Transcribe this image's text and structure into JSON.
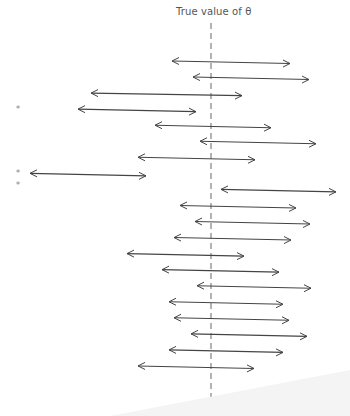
{
  "diagram": {
    "title": "True value of θ",
    "reference_line": {
      "label": "True value of θ",
      "style": "dashed"
    },
    "colors": {
      "line": "#444444",
      "dash": "#666666",
      "marker": "#888888",
      "text": "#555555"
    },
    "marker_glyph": "*",
    "interval_count": 20,
    "intervals": [
      {
        "index": 1,
        "lower": -39,
        "upper": 79,
        "contains_true": true,
        "marked": false
      },
      {
        "index": 2,
        "lower": -18,
        "upper": 98,
        "contains_true": true,
        "marked": false
      },
      {
        "index": 3,
        "lower": -120,
        "upper": 31,
        "contains_true": true,
        "marked": false
      },
      {
        "index": 4,
        "lower": -133,
        "upper": -15,
        "contains_true": false,
        "marked": true
      },
      {
        "index": 5,
        "lower": -56,
        "upper": 60,
        "contains_true": true,
        "marked": false
      },
      {
        "index": 6,
        "lower": -11,
        "upper": 105,
        "contains_true": true,
        "marked": false
      },
      {
        "index": 7,
        "lower": -73,
        "upper": 44,
        "contains_true": true,
        "marked": false
      },
      {
        "index": 8,
        "lower": -181,
        "upper": -65,
        "contains_true": false,
        "marked": true
      },
      {
        "index": 9,
        "lower": 10,
        "upper": 125,
        "contains_true": false,
        "marked": true
      },
      {
        "index": 10,
        "lower": -31,
        "upper": 85,
        "contains_true": true,
        "marked": false
      },
      {
        "index": 11,
        "lower": -16,
        "upper": 99,
        "contains_true": true,
        "marked": false
      },
      {
        "index": 12,
        "lower": -37,
        "upper": 80,
        "contains_true": true,
        "marked": false
      },
      {
        "index": 13,
        "lower": -84,
        "upper": 33,
        "contains_true": true,
        "marked": false
      },
      {
        "index": 14,
        "lower": -49,
        "upper": 68,
        "contains_true": true,
        "marked": false
      },
      {
        "index": 15,
        "lower": -14,
        "upper": 100,
        "contains_true": true,
        "marked": false
      },
      {
        "index": 16,
        "lower": -42,
        "upper": 72,
        "contains_true": true,
        "marked": false
      },
      {
        "index": 17,
        "lower": -37,
        "upper": 78,
        "contains_true": true,
        "marked": false
      },
      {
        "index": 18,
        "lower": -20,
        "upper": 96,
        "contains_true": true,
        "marked": false
      },
      {
        "index": 19,
        "lower": -42,
        "upper": 72,
        "contains_true": true,
        "marked": false
      },
      {
        "index": 20,
        "lower": -73,
        "upper": 43,
        "contains_true": true,
        "marked": false
      }
    ]
  }
}
